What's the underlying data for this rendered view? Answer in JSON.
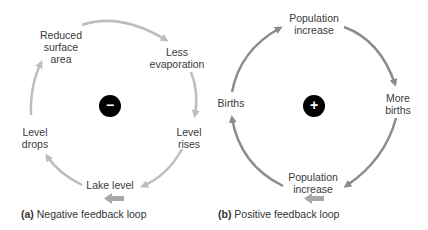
{
  "colors": {
    "negative_loop_arrows": "#bdbdbd",
    "positive_loop_arrows": "#8c8c8c",
    "flow_arrow": "#a8a8a8",
    "badge": "#000000"
  },
  "negative_loop": {
    "badge_symbol": "−",
    "nodes": [
      {
        "line1": "Reduced",
        "line2": "surface",
        "line3": "area"
      },
      {
        "line1": "Less",
        "line2": "evaporation"
      },
      {
        "line1": "Level",
        "line2": "rises"
      },
      {
        "line1": "Lake level"
      },
      {
        "line1": "Level",
        "line2": "drops"
      }
    ],
    "caption_tag": "(a)",
    "caption_text": " Negative feedback loop"
  },
  "positive_loop": {
    "badge_symbol": "+",
    "nodes": [
      {
        "line1": "Population",
        "line2": "increase"
      },
      {
        "line1": "More",
        "line2": "births"
      },
      {
        "line1": "Population",
        "line2": "increase"
      },
      {
        "line1": "Births"
      }
    ],
    "caption_tag": "(b)",
    "caption_text": " Positive feedback loop"
  }
}
